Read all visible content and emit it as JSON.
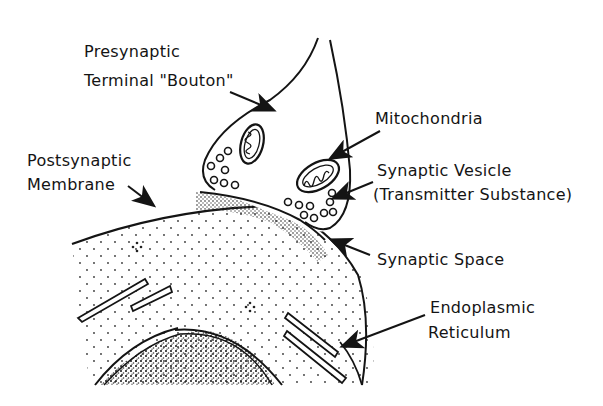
{
  "diagram": {
    "type": "anatomical-illustration",
    "labels": {
      "presynaptic_line1": "Presynaptic",
      "presynaptic_line2": "Terminal \"Bouton\"",
      "mitochondria": "Mitochondria",
      "postsynaptic_line1": "Postsynaptic",
      "postsynaptic_line2": "Membrane",
      "vesicle_line1": "Synaptic Vesicle",
      "vesicle_line2": "(Transmitter Substance)",
      "synaptic_space": "Synaptic Space",
      "er_line1": "Endoplasmic",
      "er_line2": "Reticulum"
    },
    "colors": {
      "ink": "#141414",
      "background": "#ffffff"
    }
  }
}
